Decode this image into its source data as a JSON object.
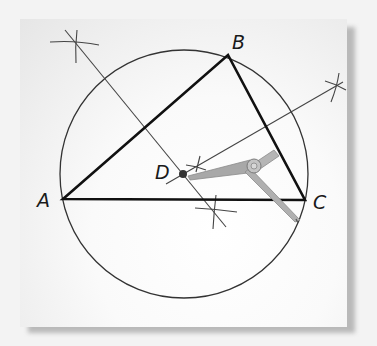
{
  "figure": {
    "points": [
      {
        "name": "A",
        "x": 63,
        "y": 199
      },
      {
        "name": "B",
        "x": 228,
        "y": 55
      },
      {
        "name": "C",
        "x": 305,
        "y": 200
      },
      {
        "name": "D",
        "x": 184,
        "y": 174
      }
    ],
    "labels": {
      "A": "A",
      "B": "B",
      "C": "C",
      "D": "D"
    },
    "circle": {
      "center": "D",
      "radius": 127
    },
    "colors": {
      "lines": "#111111",
      "construction": "#444444",
      "compass": "#9a9a9a",
      "background": "#f3f3f3"
    }
  }
}
